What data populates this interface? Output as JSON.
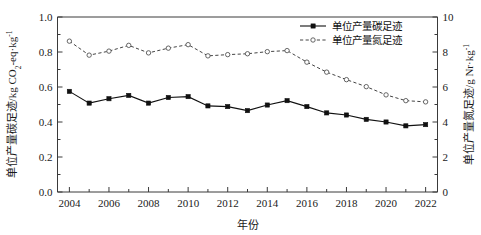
{
  "chart_data": {
    "type": "line",
    "title": "",
    "xlabel": "年份",
    "ylabel": "单位产量碳足迹/kg CO2-eq·kg-1",
    "ylabel_right": "单位产量氮足迹/g Nr·kg-1",
    "x": [
      2004,
      2005,
      2006,
      2007,
      2008,
      2009,
      2010,
      2011,
      2012,
      2013,
      2014,
      2015,
      2016,
      2017,
      2018,
      2019,
      2020,
      2021,
      2022
    ],
    "xlim": [
      2003.4,
      2022.6
    ],
    "ylim": [
      0.0,
      1.0
    ],
    "ylim_right": [
      0,
      10
    ],
    "xticks": [
      "2004",
      "2006",
      "2008",
      "2010",
      "2012",
      "2014",
      "2016",
      "2018",
      "2020",
      "2022"
    ],
    "yticks": [
      "0.0",
      "0.2",
      "0.4",
      "0.6",
      "0.8",
      "1.0"
    ],
    "yticks_right": [
      "0",
      "2",
      "4",
      "6",
      "8",
      "10"
    ],
    "grid": false,
    "legend_position": "top-right",
    "series": [
      {
        "name": "单位产量碳足迹",
        "axis": "left",
        "marker": "filled-square",
        "linestyle": "solid",
        "color": "#111111",
        "values": [
          0.575,
          0.508,
          0.533,
          0.552,
          0.508,
          0.54,
          0.545,
          0.492,
          0.488,
          0.465,
          0.497,
          0.522,
          0.488,
          0.452,
          0.44,
          0.415,
          0.4,
          0.378,
          0.385
        ]
      },
      {
        "name": "单位产量氮足迹",
        "axis": "right",
        "marker": "open-circle",
        "linestyle": "dashed",
        "color": "#555555",
        "values": [
          8.62,
          7.82,
          8.05,
          8.38,
          7.95,
          8.22,
          8.42,
          7.78,
          7.85,
          7.9,
          8.02,
          8.08,
          7.42,
          6.85,
          6.42,
          6.02,
          5.55,
          5.22,
          5.15
        ]
      }
    ]
  },
  "axis_labels": {
    "y_left_part1": "单位产量碳足迹/kg CO",
    "y_left_sub": "2",
    "y_left_part2": "-eq·kg",
    "y_left_sup": "-1",
    "y_right_part1": "单位产量氮足迹/g Nr·kg",
    "y_right_sup": "-1",
    "x_label": "年份"
  },
  "legend": {
    "items": [
      {
        "label": "单位产量碳足迹",
        "style": "solid-square"
      },
      {
        "label": "单位产量氮足迹",
        "style": "dashed-circle"
      }
    ]
  },
  "colors": {
    "carbon": "#111111",
    "nitrogen": "#555555",
    "axis": "#3a3a3a",
    "background": "#ffffff"
  }
}
